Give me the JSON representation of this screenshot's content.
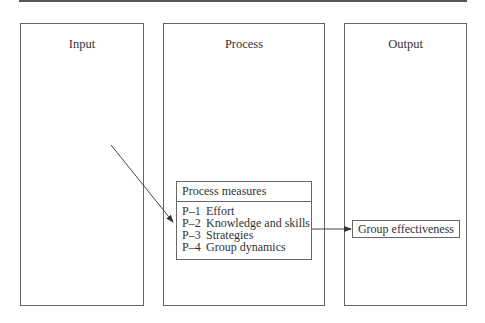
{
  "diagram": {
    "panels": [
      {
        "id": "input",
        "title": "Input"
      },
      {
        "id": "process",
        "title": "Process"
      },
      {
        "id": "output",
        "title": "Output"
      }
    ],
    "process_measures": {
      "title": "Process measures",
      "items": [
        {
          "code": "P–1",
          "label": "Effort"
        },
        {
          "code": "P–2",
          "label": "Knowledge and skills"
        },
        {
          "code": "P–3",
          "label": "Strategies"
        },
        {
          "code": "P–4",
          "label": "Group dynamics"
        }
      ]
    },
    "output_box": {
      "label": "Group effectiveness"
    },
    "arrows": [
      {
        "from": "input-panel",
        "to": "process-measures-box"
      },
      {
        "from": "process-measures-box",
        "to": "group-effectiveness-box"
      }
    ]
  }
}
